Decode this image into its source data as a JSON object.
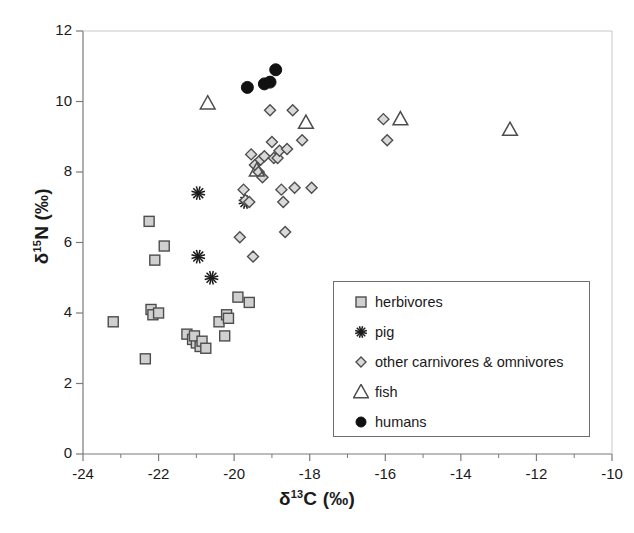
{
  "chart_data": {
    "type": "scatter",
    "title": "",
    "xlabel": "δ13C (‰)",
    "ylabel": "δ15N (‰)",
    "xlabel_parts": {
      "delta": "δ",
      "sup": "13",
      "element": "C",
      "unit": "(‰)"
    },
    "ylabel_parts": {
      "delta": "δ",
      "sup": "15",
      "element": "N",
      "unit": "(‰)"
    },
    "xlim": [
      -24,
      -10
    ],
    "ylim": [
      0,
      12
    ],
    "xticks": [
      -24,
      -22,
      -20,
      -18,
      -16,
      -14,
      -12,
      -10
    ],
    "xtick_labels": [
      "-24",
      "-22",
      "-20",
      "-18",
      "-16",
      "-14",
      "-12",
      "-10"
    ],
    "yticks": [
      0,
      2,
      4,
      6,
      8,
      10,
      12
    ],
    "ytick_labels": [
      "0",
      "2",
      "4",
      "6",
      "8",
      "10",
      "12"
    ],
    "x_minor_tick_step": 1,
    "grid": false,
    "legend_position": "inside-lower-right",
    "series": [
      {
        "name": "herbivores",
        "marker": "square",
        "fill": "#d0d0d0",
        "edge": "#4d4d4d",
        "points": [
          [
            -23.2,
            3.75
          ],
          [
            -22.2,
            4.1
          ],
          [
            -22.15,
            3.95
          ],
          [
            -22.0,
            4.0
          ],
          [
            -22.25,
            6.6
          ],
          [
            -22.1,
            5.5
          ],
          [
            -22.35,
            2.7
          ],
          [
            -21.85,
            5.9
          ],
          [
            -21.25,
            3.4
          ],
          [
            -21.1,
            3.25
          ],
          [
            -21.0,
            3.15
          ],
          [
            -21.05,
            3.35
          ],
          [
            -20.9,
            3.05
          ],
          [
            -20.85,
            3.2
          ],
          [
            -20.75,
            3.0
          ],
          [
            -20.4,
            3.75
          ],
          [
            -20.25,
            3.35
          ],
          [
            -20.2,
            3.95
          ],
          [
            -20.15,
            3.85
          ],
          [
            -19.9,
            4.45
          ],
          [
            -19.6,
            4.3
          ]
        ]
      },
      {
        "name": "pig",
        "marker": "asterisk",
        "fill": "none",
        "edge": "#1a1a1a",
        "points": [
          [
            -20.95,
            7.4
          ],
          [
            -20.95,
            5.6
          ],
          [
            -20.6,
            5.0
          ],
          [
            -19.7,
            7.15
          ]
        ]
      },
      {
        "name": "other carnivores & omnivores",
        "marker": "diamond",
        "fill": "#d9d9d9",
        "edge": "#4d4d4d",
        "points": [
          [
            -19.85,
            6.15
          ],
          [
            -19.75,
            7.5
          ],
          [
            -19.7,
            7.2
          ],
          [
            -19.6,
            7.15
          ],
          [
            -19.55,
            8.5
          ],
          [
            -19.5,
            5.6
          ],
          [
            -19.45,
            8.2
          ],
          [
            -19.35,
            8.0
          ],
          [
            -19.3,
            8.35
          ],
          [
            -19.25,
            7.85
          ],
          [
            -19.2,
            8.45
          ],
          [
            -19.05,
            9.75
          ],
          [
            -19.0,
            8.85
          ],
          [
            -18.95,
            8.4
          ],
          [
            -18.85,
            8.4
          ],
          [
            -18.8,
            8.6
          ],
          [
            -18.75,
            7.5
          ],
          [
            -18.7,
            7.15
          ],
          [
            -18.65,
            6.3
          ],
          [
            -18.6,
            8.65
          ],
          [
            -18.45,
            9.75
          ],
          [
            -18.4,
            7.55
          ],
          [
            -18.2,
            8.9
          ],
          [
            -17.95,
            7.55
          ],
          [
            -15.95,
            8.9
          ],
          [
            -16.05,
            9.5
          ]
        ]
      },
      {
        "name": "fish",
        "marker": "triangle",
        "fill": "none",
        "edge": "#4d4d4d",
        "points": [
          [
            -20.7,
            9.95
          ],
          [
            -19.4,
            8.05
          ],
          [
            -18.1,
            9.4
          ],
          [
            -15.6,
            9.5
          ],
          [
            -12.7,
            9.2
          ]
        ]
      },
      {
        "name": "humans",
        "marker": "circle",
        "fill": "#111111",
        "edge": "#111111",
        "points": [
          [
            -19.65,
            10.4
          ],
          [
            -19.2,
            10.5
          ],
          [
            -19.05,
            10.55
          ],
          [
            -18.9,
            10.9
          ]
        ]
      }
    ],
    "legend": [
      {
        "label": "herbivores",
        "marker": "square"
      },
      {
        "label": "pig",
        "marker": "asterisk"
      },
      {
        "label": "other carnivores & omnivores",
        "marker": "diamond"
      },
      {
        "label": "fish",
        "marker": "triangle"
      },
      {
        "label": "humans",
        "marker": "circle"
      }
    ],
    "colors": {
      "axis": "#7a7a7a",
      "text": "#1a1a1a",
      "herbivore_fill": "#d0d0d0",
      "diamond_fill": "#d9d9d9",
      "marker_edge": "#4d4d4d",
      "human_fill": "#111111"
    }
  }
}
